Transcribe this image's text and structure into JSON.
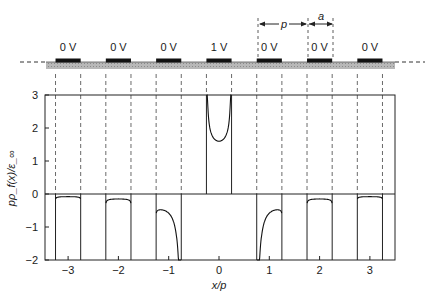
{
  "electrodes": {
    "labels": [
      "0 V",
      "0 V",
      "0 V",
      "1 V",
      "0 V",
      "0 V",
      "0 V"
    ],
    "positions": [
      -3,
      -2,
      -1,
      0,
      1,
      2,
      3
    ],
    "half_width": 0.25
  },
  "dimensions": {
    "period_label": "p",
    "width_label": "a"
  },
  "chart_data": {
    "type": "line",
    "title": "",
    "xlabel": "x/p",
    "ylabel": "pρ_f(x)/ε_∞",
    "xlim": [
      -3.5,
      3.5
    ],
    "ylim": [
      -2,
      3
    ],
    "xticks": [
      -3,
      -2,
      -1,
      0,
      1,
      2,
      3
    ],
    "xtick_labels": [
      "−3",
      "−2",
      "−1",
      "0",
      "1",
      "2",
      "3"
    ],
    "yticks": [
      3,
      2,
      1,
      0,
      -1,
      -2
    ],
    "ytick_labels": [
      "3",
      "2",
      "1",
      "0",
      "−1",
      "−2"
    ],
    "grid": false,
    "strip_half_width": 0.25,
    "series": [
      {
        "name": "electrode -3",
        "center": -3,
        "min_value": -0.08,
        "shape": "flat"
      },
      {
        "name": "electrode -2",
        "center": -2,
        "min_value": -0.15,
        "shape": "flat"
      },
      {
        "name": "electrode -1",
        "center": -1,
        "min_value": -0.42,
        "shape": "skewed-right-diverging"
      },
      {
        "name": "electrode 0",
        "center": 0,
        "min_value": 1.6,
        "shape": "u-diverging"
      },
      {
        "name": "electrode 1",
        "center": 1,
        "min_value": -0.42,
        "shape": "skewed-left-diverging"
      },
      {
        "name": "electrode 2",
        "center": 2,
        "min_value": -0.15,
        "shape": "flat"
      },
      {
        "name": "electrode 3",
        "center": 3,
        "min_value": -0.08,
        "shape": "flat"
      }
    ]
  }
}
